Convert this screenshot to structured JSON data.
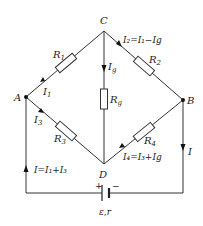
{
  "nodes": {
    "A": "A",
    "B": "B",
    "C": "C",
    "D": "D"
  },
  "resistors": {
    "R1": {
      "base": "R",
      "sub": "1"
    },
    "R2": {
      "base": "R",
      "sub": "2"
    },
    "R3": {
      "base": "R",
      "sub": "3"
    },
    "R4": {
      "base": "R",
      "sub": "4"
    },
    "Rg": {
      "base": "R",
      "sub": "g"
    }
  },
  "currents": {
    "I1": {
      "base": "I",
      "sub": "1"
    },
    "I3": {
      "base": "I",
      "sub": "3"
    },
    "Ig": {
      "base": "I",
      "sub": "g"
    },
    "I2_eq": "I₂=I₁−Ig",
    "I4_eq": "I₄=I₃+Ig",
    "I_total_eq": "I=I₁+I₃",
    "I": "I"
  },
  "battery": {
    "plus": "+",
    "minus": "−",
    "label": "ε,r"
  }
}
